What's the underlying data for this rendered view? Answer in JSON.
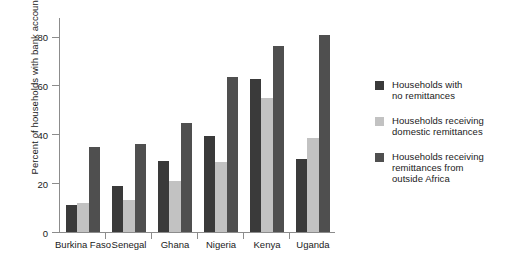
{
  "chart_data": {
    "type": "bar",
    "title": "",
    "xlabel": "",
    "ylabel": "Percent of households with bank accounts",
    "ylim": [
      0,
      88
    ],
    "yticks": [
      0,
      20,
      40,
      60,
      80
    ],
    "ytick_labels": [
      "0",
      "20",
      "40",
      "60",
      "80"
    ],
    "grid": false,
    "legend_position": "right",
    "categories": [
      "Burkina Faso",
      "Senegal",
      "Ghana",
      "Nigeria",
      "Kenya",
      "Uganda"
    ],
    "series": [
      {
        "name": "Households with no remittances",
        "color": "#3a3a3a",
        "values": [
          11,
          19,
          29,
          39.5,
          62.5,
          30
        ]
      },
      {
        "name": "Households receiving domestic remittances",
        "color": "#c2c2c2",
        "values": [
          12,
          13,
          21,
          28.5,
          55,
          38.5
        ]
      },
      {
        "name": "Households receiving remittances from outside Africa",
        "color": "#4f4f4f",
        "values": [
          35,
          36,
          44.5,
          63.5,
          76,
          80.5
        ]
      }
    ]
  },
  "legend": {
    "items": [
      {
        "label_line1": "Households with",
        "label_line2": "no remittances",
        "label_line3": ""
      },
      {
        "label_line1": "Households receiving",
        "label_line2": "domestic remittances",
        "label_line3": ""
      },
      {
        "label_line1": "Households receiving",
        "label_line2": "remittances from",
        "label_line3": "outside Africa"
      }
    ]
  }
}
